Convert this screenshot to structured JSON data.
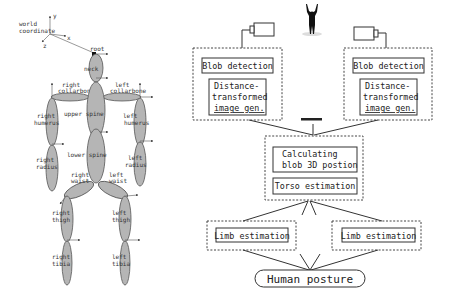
{
  "skeleton": {
    "world_coordinate_label": [
      "world",
      "coordinate"
    ],
    "axes": {
      "x": "x",
      "y": "y",
      "z": "z"
    },
    "root_label": "root",
    "segments": [
      {
        "id": "neck",
        "label": [
          "neck"
        ]
      },
      {
        "id": "right-collarbone",
        "label": [
          "right",
          "collarbone"
        ]
      },
      {
        "id": "left-collarbone",
        "label": [
          "left",
          "collarbone"
        ]
      },
      {
        "id": "right-humerus",
        "label": [
          "right",
          "humerus"
        ]
      },
      {
        "id": "left-humerus",
        "label": [
          "left",
          "humerus"
        ]
      },
      {
        "id": "upper-spine",
        "label": [
          "upper spine"
        ]
      },
      {
        "id": "lower-spine",
        "label": [
          "lower spine"
        ]
      },
      {
        "id": "right-radius",
        "label": [
          "right",
          "radius"
        ]
      },
      {
        "id": "left-radius",
        "label": [
          "left",
          "radius"
        ]
      },
      {
        "id": "right-waist",
        "label": [
          "right",
          "waist"
        ]
      },
      {
        "id": "left-waist",
        "label": [
          "left",
          "waist"
        ]
      },
      {
        "id": "right-thigh",
        "label": [
          "right",
          "thigh"
        ]
      },
      {
        "id": "left-thigh",
        "label": [
          "left",
          "thigh"
        ]
      },
      {
        "id": "right-tibia",
        "label": [
          "right",
          "tibia"
        ]
      },
      {
        "id": "left-tibia",
        "label": [
          "left",
          "tibia"
        ]
      }
    ]
  },
  "flowchart": {
    "cameras": [
      "camera-left",
      "camera-right"
    ],
    "person_icon": "person-arms-raised",
    "camera_units": [
      {
        "blob_detection": "Blob detection",
        "distance_lines": [
          "Distance-",
          "transformed",
          "image gen."
        ]
      },
      {
        "blob_detection": "Blob detection",
        "distance_lines": [
          "Distance-",
          "transformed",
          "image gen."
        ]
      }
    ],
    "ellipsis": "........",
    "center": {
      "calculating_lines": [
        "Calculating",
        "blob 3D postion"
      ],
      "torso": "Torso estimation"
    },
    "limbs": [
      "Limb estimation",
      "Limb estimation"
    ],
    "output": "Human posture"
  }
}
